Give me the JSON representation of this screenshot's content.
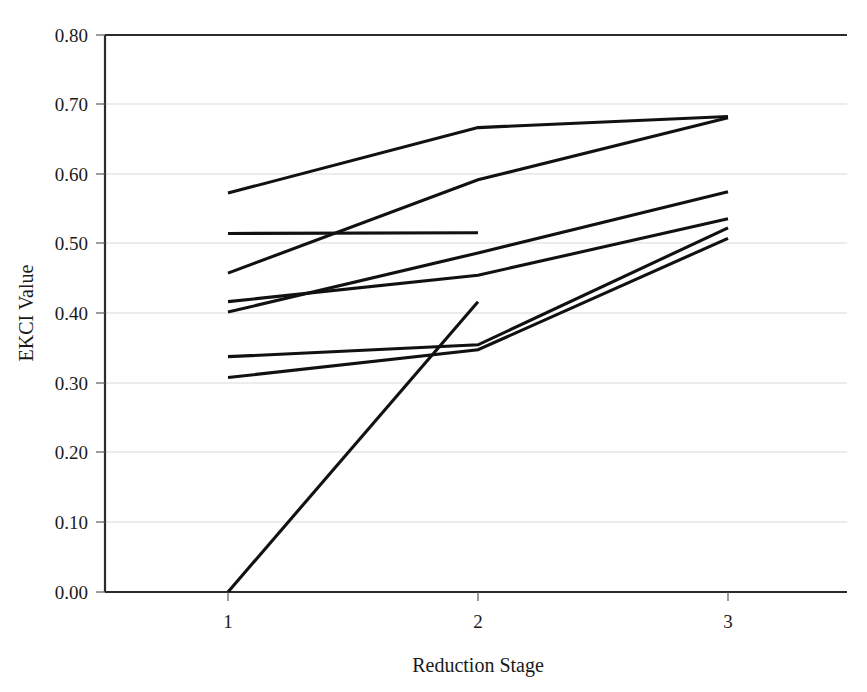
{
  "chart_data": {
    "type": "line",
    "title": "",
    "subtitle": "",
    "xlabel": "Reduction Stage",
    "ylabel": "EKCI Value",
    "x": [
      1,
      2,
      3
    ],
    "x_tick_labels": [
      "1",
      "2",
      "3"
    ],
    "y_tick_labels": [
      "0.00",
      "0.10",
      "0.20",
      "0.30",
      "0.40",
      "0.50",
      "0.60",
      "0.70",
      "0.80"
    ],
    "y_ticks": [
      0.0,
      0.1,
      0.2,
      0.3,
      0.4,
      0.5,
      0.6,
      0.7,
      0.8
    ],
    "ylim": [
      0.0,
      0.8
    ],
    "xlim": [
      0.55,
      3.45
    ],
    "grid": "horizontal",
    "legend": "none",
    "line_color": "#111111",
    "grid_color": "#d9d9d9",
    "axis_color": "#2b2b2b",
    "series": [
      {
        "name": "Series 1",
        "values": [
          0.573,
          0.667,
          0.683
        ]
      },
      {
        "name": "Series 2",
        "values": [
          0.458,
          0.592,
          0.681
        ]
      },
      {
        "name": "Series 3",
        "values": [
          0.515,
          0.516,
          null
        ]
      },
      {
        "name": "Series 4",
        "values": [
          0.402,
          0.487,
          0.575
        ]
      },
      {
        "name": "Series 5",
        "values": [
          0.417,
          0.455,
          0.536
        ]
      },
      {
        "name": "Series 6",
        "values": [
          0.338,
          0.355,
          0.523
        ]
      },
      {
        "name": "Series 7",
        "values": [
          0.308,
          0.348,
          0.508
        ]
      },
      {
        "name": "Series 8",
        "values": [
          0.0,
          0.417,
          null
        ]
      }
    ]
  },
  "axes": {
    "y_title": "EKCI Value",
    "x_title": "Reduction Stage"
  }
}
